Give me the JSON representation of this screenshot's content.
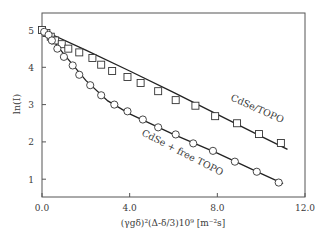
{
  "chart_data": {
    "type": "scatter",
    "title": "",
    "xlabel": "(γgδ)²(Δ-δ/3)10⁹ [m⁻²s]",
    "ylabel": "ln(I)",
    "xlim": [
      0.0,
      12.0
    ],
    "ylim": [
      0.5,
      5.45
    ],
    "xticks": [
      0.0,
      4.0,
      8.0,
      12.0
    ],
    "xtick_labels": [
      "0.0",
      "4.0",
      "8.0",
      "12.0"
    ],
    "yticks": [
      1,
      2,
      3,
      4,
      5
    ],
    "ytick_labels": [
      "1",
      "2",
      "3",
      "4",
      "5"
    ],
    "grid": false,
    "legend": "none (inline curve labels)",
    "series": [
      {
        "name": "CdSe/TOPO",
        "marker": "square",
        "label_text": "CdSe/TOPO",
        "x": [
          0.0,
          0.2,
          0.4,
          0.6,
          0.9,
          1.2,
          1.7,
          2.3,
          2.7,
          3.2,
          3.9,
          4.5,
          5.3,
          6.1,
          7.0,
          7.9,
          8.9,
          9.9,
          10.9
        ],
        "y": [
          5.0,
          4.92,
          4.82,
          4.72,
          4.62,
          4.5,
          4.4,
          4.25,
          4.07,
          3.9,
          3.74,
          3.58,
          3.36,
          3.12,
          2.97,
          2.69,
          2.5,
          2.21,
          1.97
        ],
        "fit": {
          "x": [
            0.0,
            2.0,
            4.0,
            6.0,
            8.0,
            10.0,
            11.2
          ],
          "y": [
            5.0,
            4.46,
            3.9,
            3.33,
            2.74,
            2.15,
            1.8
          ]
        }
      },
      {
        "name": "CdSe + free TOPO",
        "marker": "circle",
        "label_text": "CdSe + free TOPO",
        "x": [
          0.1,
          0.3,
          0.45,
          0.7,
          1.0,
          1.4,
          1.7,
          2.2,
          2.7,
          3.3,
          3.9,
          4.6,
          5.3,
          6.1,
          6.9,
          7.8,
          8.8,
          9.8,
          10.8
        ],
        "y": [
          4.95,
          4.87,
          4.72,
          4.5,
          4.28,
          4.05,
          3.8,
          3.52,
          3.25,
          3.0,
          2.82,
          2.6,
          2.39,
          2.2,
          1.96,
          1.76,
          1.47,
          1.2,
          0.91
        ],
        "fit": {
          "x": [
            0.0,
            0.5,
            1.0,
            2.0,
            3.0,
            4.0,
            6.0,
            8.0,
            10.0,
            11.0
          ],
          "y": [
            5.0,
            4.72,
            4.35,
            3.65,
            3.1,
            2.75,
            2.2,
            1.7,
            1.15,
            0.88
          ]
        }
      }
    ]
  }
}
